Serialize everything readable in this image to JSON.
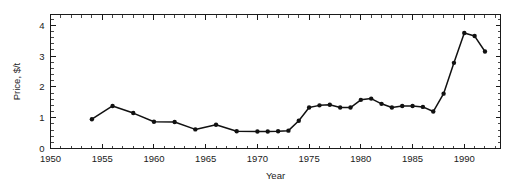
{
  "chart_data": {
    "type": "line",
    "title": "",
    "xlabel": "Year",
    "ylabel": "Price, $/t",
    "xlim": [
      1950,
      1993.5
    ],
    "ylim": [
      0,
      4.35
    ],
    "x_ticks_major": [
      1950,
      1955,
      1960,
      1965,
      1970,
      1975,
      1980,
      1985,
      1990
    ],
    "x_tick_labels": [
      "1950",
      "1955",
      "1960",
      "1965",
      "1970",
      "1975",
      "1980",
      "1985",
      "1990"
    ],
    "x_minor_step": 1,
    "y_ticks_major": [
      0,
      1,
      2,
      3,
      4
    ],
    "y_tick_labels": [
      "0",
      "1",
      "2",
      "3",
      "4"
    ],
    "y_minor_step": 0.2,
    "grid": false,
    "legend": null,
    "marker": "filled-circle",
    "line_color": "#111111",
    "marker_color": "#111111",
    "axis_color": "#1a1a1a",
    "background_color": "#ffffff",
    "series": [
      {
        "name": "Price",
        "x": [
          1954,
          1956,
          1958,
          1960,
          1962,
          1964,
          1966,
          1968,
          1970,
          1971,
          1972,
          1973,
          1974,
          1975,
          1976,
          1977,
          1978,
          1979,
          1980,
          1981,
          1982,
          1983,
          1984,
          1985,
          1986,
          1987,
          1988,
          1989,
          1990,
          1991,
          1992
        ],
        "values": [
          0.95,
          1.38,
          1.15,
          0.87,
          0.86,
          0.62,
          0.77,
          0.56,
          0.55,
          0.55,
          0.56,
          0.58,
          0.9,
          1.33,
          1.4,
          1.42,
          1.33,
          1.33,
          1.58,
          1.62,
          1.45,
          1.33,
          1.38,
          1.38,
          1.35,
          1.2,
          1.78,
          2.78,
          3.75,
          3.65,
          3.15
        ]
      }
    ]
  }
}
